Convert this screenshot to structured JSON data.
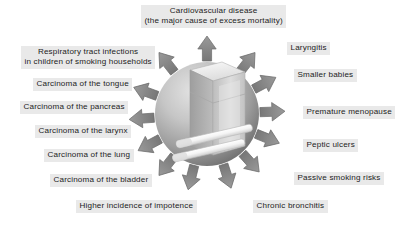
{
  "figure": {
    "center": {
      "subject": "cigarette-pack-and-cigarettes",
      "sphere_label": "globe-of-smoking-harm"
    },
    "colors": {
      "background": "#ffffff",
      "label_band": "#e9e9e9",
      "label_text": "#1c1c1c",
      "arrow_fill": "#8a8a8a",
      "arrow_stroke": "#6f6f6f",
      "sphere_light": "#d8d8d8",
      "sphere_dark": "#7e7e7e",
      "pack_light": "#f2f2f2",
      "pack_mid": "#cfcfcf",
      "pack_dark": "#a8a8a8",
      "cigarette": "#f7f7f7"
    }
  },
  "risks": [
    {
      "id": "cardiovascular-disease",
      "text": "Cardiovascular disease\n(the major cause of excess mortality)",
      "align": "center",
      "left": 141,
      "top": 5,
      "arrow_angle": -90
    },
    {
      "id": "laryngitis",
      "text": "Laryngitis",
      "align": "left",
      "left": 287,
      "top": 42,
      "arrow_angle": -52
    },
    {
      "id": "respiratory-tract-infections",
      "text": "Respiratory tract infections\nin children of smoking households",
      "align": "center",
      "left": 21,
      "top": 46,
      "arrow_angle": -128
    },
    {
      "id": "smaller-babies",
      "text": "Smaller babies",
      "align": "left",
      "left": 294,
      "top": 69,
      "arrow_angle": -28
    },
    {
      "id": "carcinoma-tongue",
      "text": "Carcinoma of the tongue",
      "align": "right",
      "left": 33,
      "top": 78,
      "arrow_angle": -152
    },
    {
      "id": "carcinoma-pancreas",
      "text": "Carcinoma of the pancreas",
      "align": "right",
      "left": 20,
      "top": 101,
      "arrow_angle": -172
    },
    {
      "id": "premature-menopause",
      "text": "Premature menopause",
      "align": "left",
      "left": 303,
      "top": 106,
      "arrow_angle": -2
    },
    {
      "id": "carcinoma-larynx",
      "text": "Carcinoma of the larynx",
      "align": "right",
      "left": 35,
      "top": 125,
      "arrow_angle": 170
    },
    {
      "id": "peptic-ulcers",
      "text": "Peptic ulcers",
      "align": "left",
      "left": 303,
      "top": 139,
      "arrow_angle": 22
    },
    {
      "id": "carcinoma-lung",
      "text": "Carcinoma of the lung",
      "align": "right",
      "left": 44,
      "top": 149,
      "arrow_angle": 150
    },
    {
      "id": "carcinoma-bladder",
      "text": "Carcinoma of the bladder",
      "align": "right",
      "left": 50,
      "top": 174,
      "arrow_angle": 128
    },
    {
      "id": "passive-smoking-risks",
      "text": "Passive smoking risks",
      "align": "left",
      "left": 294,
      "top": 172,
      "arrow_angle": 48
    },
    {
      "id": "higher-incidence-impotence",
      "text": "Higher incidence of impotence",
      "align": "right",
      "left": 76,
      "top": 200,
      "arrow_angle": 104
    },
    {
      "id": "chronic-bronchitis",
      "text": "Chronic bronchitis",
      "align": "left",
      "left": 253,
      "top": 200,
      "arrow_angle": 74
    }
  ]
}
